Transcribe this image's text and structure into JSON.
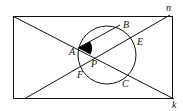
{
  "diagram": {
    "type": "geometry",
    "labels": {
      "A": "A",
      "B": "B",
      "C": "C",
      "E": "E",
      "F": "F",
      "P": "P",
      "n": "n",
      "k": "k"
    },
    "colors": {
      "stroke": "#111111",
      "background": "#ffffff",
      "fill": "#000000"
    }
  }
}
